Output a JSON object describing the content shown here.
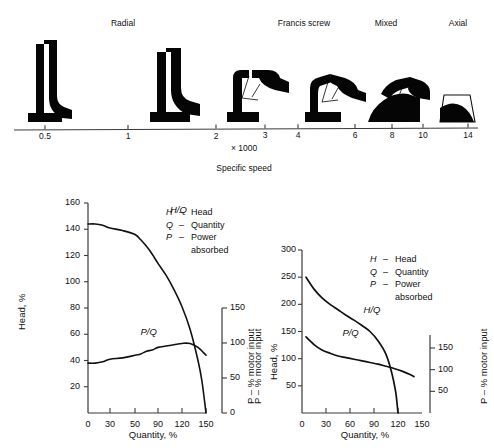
{
  "figure": {
    "top_panel": {
      "axis_caption_1": "× 1000",
      "axis_caption_2": "Specific speed",
      "category_labels": [
        {
          "text": "Radial",
          "x": 123
        },
        {
          "text": "Francis screw",
          "x": 304
        },
        {
          "text": "Mixed",
          "x": 386
        },
        {
          "text": "Axial",
          "x": 458
        }
      ],
      "tick_labels": [
        {
          "text": "0.5",
          "x": 45
        },
        {
          "text": "1",
          "x": 128
        },
        {
          "text": "2",
          "x": 216
        },
        {
          "text": "3",
          "x": 265
        },
        {
          "text": "4",
          "x": 298
        },
        {
          "text": "6",
          "x": 355
        },
        {
          "text": "8",
          "x": 392
        },
        {
          "text": "10",
          "x": 423
        },
        {
          "text": "14",
          "x": 468
        }
      ],
      "impeller_names": [
        "impeller-radial-narrow",
        "impeller-radial-wide",
        "impeller-francis",
        "impeller-francis-screw",
        "impeller-mixed-flow",
        "impeller-axial-flow"
      ]
    },
    "legend": {
      "rows": [
        {
          "symbol": "H",
          "dash": "–",
          "text": "Head"
        },
        {
          "symbol": "Q",
          "dash": "–",
          "text": "Quantity"
        },
        {
          "symbol": "P",
          "dash": "–",
          "text": "Power"
        },
        {
          "symbol": "",
          "dash": "",
          "text": "absorbed"
        }
      ]
    }
  },
  "chart_data": [
    {
      "type": "line",
      "name": "centrifugal-pump-characteristic",
      "title": "",
      "xlabel": "Quantity, %",
      "ylabel": "Head, %",
      "y2label": "P – % motor input",
      "xlim": [
        0,
        150
      ],
      "ylim": [
        0,
        160
      ],
      "y2lim": [
        0,
        150
      ],
      "grid": false,
      "xticks": [
        0,
        30,
        50,
        90,
        120,
        150
      ],
      "xtick_labels": [
        "0",
        "30",
        "50",
        "90",
        "120",
        "150"
      ],
      "yticks": [
        20,
        40,
        60,
        80,
        100,
        120,
        140,
        160
      ],
      "ytick_labels": [
        "20",
        "40",
        "60",
        "80",
        "100",
        "120",
        "140",
        "160"
      ],
      "y2ticks": [
        0,
        50,
        100,
        150
      ],
      "y2tick_labels": [
        "0",
        "50",
        "100",
        "150"
      ],
      "series": [
        {
          "name": "H/Q",
          "label": "H/Q",
          "axis": "left",
          "label_x": 110,
          "label_y": 144,
          "x": [
            0,
            10,
            20,
            30,
            40,
            50,
            60,
            70,
            80,
            90,
            100,
            110,
            120,
            130,
            140,
            145,
            150
          ],
          "values": [
            144,
            144,
            143,
            141,
            139,
            136,
            132,
            127,
            121,
            114,
            105,
            94,
            81,
            64,
            40,
            24,
            0
          ]
        },
        {
          "name": "P/Q",
          "label": "P/Q",
          "axis": "right",
          "label_x": 70,
          "label_y": 56,
          "x": [
            0,
            10,
            20,
            30,
            40,
            50,
            60,
            70,
            80,
            90,
            100,
            110,
            120,
            130,
            140,
            150
          ],
          "values_left_scale": [
            38,
            38,
            39,
            41,
            42,
            44,
            45,
            47,
            48,
            50,
            51,
            52,
            53,
            53,
            50,
            44
          ]
        }
      ]
    },
    {
      "type": "line",
      "name": "axial-flow-pump-characteristic",
      "title": "",
      "xlabel": "Quantity, %",
      "ylabel": "Head, %",
      "y1label_outer": "P – % motor input",
      "y2label": "P – % motor input",
      "xlim": [
        0,
        150
      ],
      "ylim": [
        0,
        300
      ],
      "y2lim": [
        0,
        180
      ],
      "grid": false,
      "xticks": [
        0,
        30,
        60,
        90,
        120,
        150
      ],
      "xtick_labels": [
        "0",
        "30",
        "60",
        "90",
        "120",
        "150"
      ],
      "yticks": [
        50,
        100,
        150,
        200,
        250,
        300
      ],
      "ytick_labels": [
        "50",
        "100",
        "150",
        "200",
        "250",
        "300"
      ],
      "y2ticks": [
        50,
        100,
        150
      ],
      "y2tick_labels": [
        "50",
        "100",
        "150"
      ],
      "series": [
        {
          "name": "H/Q",
          "label": "H/Q",
          "axis": "left",
          "label_x": 72,
          "label_y": 172,
          "x": [
            5,
            15,
            25,
            35,
            45,
            55,
            65,
            75,
            85,
            95,
            105,
            112,
            117,
            119,
            120
          ],
          "values": [
            250,
            228,
            212,
            200,
            190,
            180,
            171,
            161,
            150,
            133,
            108,
            75,
            40,
            15,
            0
          ]
        },
        {
          "name": "P/Q",
          "label": "P/Q",
          "axis": "left",
          "label_x": 48,
          "label_y": 128,
          "x": [
            5,
            15,
            25,
            35,
            45,
            55,
            65,
            75,
            85,
            95,
            105,
            115,
            125,
            135,
            140
          ],
          "values": [
            140,
            126,
            116,
            110,
            105,
            102,
            99,
            96,
            93,
            90,
            86,
            82,
            77,
            71,
            67
          ]
        }
      ]
    }
  ],
  "colors": {
    "ink": "#111111",
    "axis": "#3a3a3a",
    "background": "#ffffff"
  }
}
